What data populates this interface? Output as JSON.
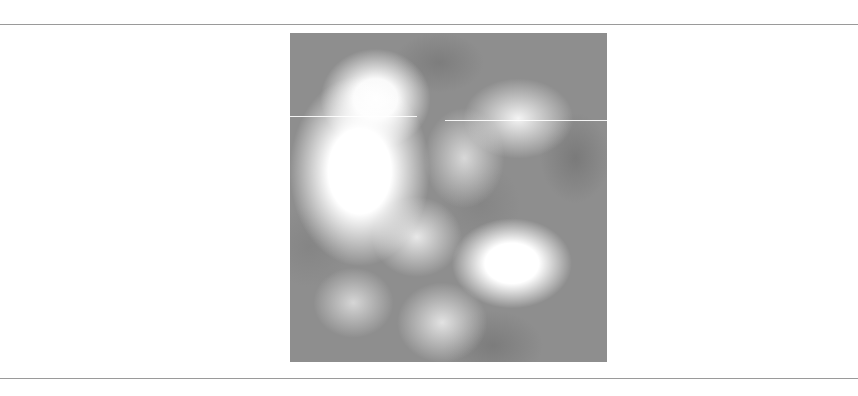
{
  "figure": {
    "colors": {
      "light": "#ffffff",
      "mid": "#8e8e8e",
      "dark": "#7a7a7a",
      "rule": "#9a9a9a"
    }
  }
}
